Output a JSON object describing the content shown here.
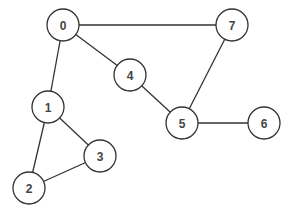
{
  "graph": {
    "title": "",
    "node_radius": 16,
    "stroke_color": "#333333",
    "label_color": "#444444",
    "nodes": [
      {
        "id": "0",
        "label": "0",
        "x": 63,
        "y": 25
      },
      {
        "id": "1",
        "label": "1",
        "x": 48,
        "y": 107
      },
      {
        "id": "2",
        "label": "2",
        "x": 29,
        "y": 188
      },
      {
        "id": "3",
        "label": "3",
        "x": 100,
        "y": 156
      },
      {
        "id": "4",
        "label": "4",
        "x": 130,
        "y": 75
      },
      {
        "id": "5",
        "label": "5",
        "x": 182,
        "y": 123
      },
      {
        "id": "6",
        "label": "6",
        "x": 264,
        "y": 123
      },
      {
        "id": "7",
        "label": "7",
        "x": 232,
        "y": 25
      }
    ],
    "edges": [
      {
        "from": "0",
        "to": "7"
      },
      {
        "from": "0",
        "to": "4"
      },
      {
        "from": "0",
        "to": "1"
      },
      {
        "from": "4",
        "to": "5"
      },
      {
        "from": "7",
        "to": "5"
      },
      {
        "from": "5",
        "to": "6"
      },
      {
        "from": "1",
        "to": "3"
      },
      {
        "from": "1",
        "to": "2"
      },
      {
        "from": "2",
        "to": "3"
      }
    ]
  }
}
